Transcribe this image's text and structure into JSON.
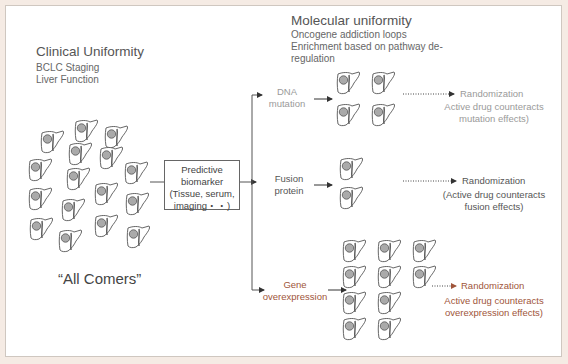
{
  "clinical": {
    "title": "Clinical Uniformity",
    "items": [
      "BCLC Staging",
      "Liver Function"
    ]
  },
  "molecular": {
    "title": "Molecular uniformity",
    "items": [
      "Oncogene addiction loops",
      "Enrichment based on pathway de-",
      "regulation"
    ]
  },
  "population_label": "“All Comers”",
  "biomarker_box": {
    "lines": [
      "Predictive",
      "biomarker",
      "(Tissue, serum,",
      "imaging・・)"
    ]
  },
  "branches": [
    {
      "label_lines": [
        "DNA",
        "mutation"
      ],
      "randomization": "Randomization",
      "note_lines": [
        "Active drug counteracts",
        "mutation effects)"
      ],
      "color": "#9a9a9a"
    },
    {
      "label_lines": [
        "Fusion",
        "protein"
      ],
      "randomization": "Randomization",
      "note_lines": [
        "(Active drug counteracts",
        "fusion effects)"
      ],
      "color": "#555555"
    },
    {
      "label_lines": [
        "Gene",
        "overexpression"
      ],
      "randomization": "Randomization",
      "note_lines": [
        "Active drug counteracts",
        "overexpression effects)"
      ],
      "color": "#a0553a"
    }
  ],
  "icons": {
    "liver": "liver-with-tumor-icon"
  },
  "colors": {
    "frame_bg": "#f5ebe4",
    "accent_brown": "#a0553a",
    "text_grey": "#9a9a9a"
  }
}
